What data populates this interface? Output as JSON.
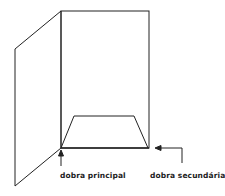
{
  "diagram": {
    "labels": {
      "main_fold": "dobra principal",
      "secondary_fold": "dobra secundária"
    },
    "colors": {
      "stroke": "#222222",
      "background": "#ffffff"
    }
  }
}
